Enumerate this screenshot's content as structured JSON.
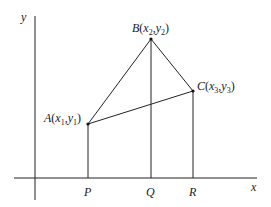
{
  "diagram": {
    "axes": {
      "x_label": "x",
      "y_label": "y"
    },
    "points": {
      "A": {
        "name": "A",
        "sub_x": "1",
        "sub_y": "1"
      },
      "B": {
        "name": "B",
        "sub_x": "2",
        "sub_y": "2"
      },
      "C": {
        "name": "C",
        "sub_x": "3",
        "sub_y": "3"
      }
    },
    "feet": {
      "P": "P",
      "Q": "Q",
      "R": "R"
    },
    "stroke_color": "#222222"
  }
}
